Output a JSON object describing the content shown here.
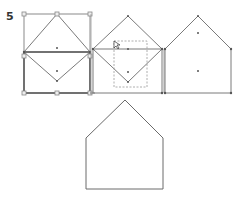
{
  "step": {
    "number": "5"
  },
  "colors": {
    "stroke": "#7a7a7a",
    "dark_stroke": "#555555",
    "handle": "#888888",
    "dot": "#555555",
    "dash": "#999999",
    "background": "#ffffff"
  },
  "panels": [
    {
      "name": "panel-1-diamond-over-square-selected",
      "description": "Diamond overlapping square with selection handles"
    },
    {
      "name": "panel-2-diamond-over-square-dragging",
      "description": "Diamond and square with dashed drag rectangle and cursor"
    },
    {
      "name": "panel-3-merged-house",
      "description": "Combined house shape with anchor points"
    },
    {
      "name": "panel-4-final-house",
      "description": "Final house outline"
    }
  ]
}
